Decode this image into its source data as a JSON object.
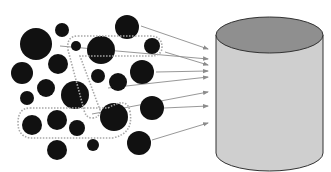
{
  "diagram": {
    "colors": {
      "background": "#ffffff",
      "item_fill": "#111111",
      "group_outline": "#a8a8a8",
      "arrow": "#8c8c8c",
      "cylinder_body": "#cfcfcf",
      "cylinder_top": "#8f8f8f",
      "cylinder_stroke": "#333333"
    },
    "items": [
      {
        "cx": 36,
        "cy": 44,
        "r": 16
      },
      {
        "cx": 62,
        "cy": 30,
        "r": 7
      },
      {
        "cx": 127,
        "cy": 27,
        "r": 12
      },
      {
        "cx": 76,
        "cy": 46,
        "r": 5
      },
      {
        "cx": 101,
        "cy": 50,
        "r": 14
      },
      {
        "cx": 152,
        "cy": 46,
        "r": 8
      },
      {
        "cx": 22,
        "cy": 73,
        "r": 11
      },
      {
        "cx": 58,
        "cy": 64,
        "r": 10
      },
      {
        "cx": 98,
        "cy": 76,
        "r": 7
      },
      {
        "cx": 118,
        "cy": 82,
        "r": 9
      },
      {
        "cx": 142,
        "cy": 72,
        "r": 12
      },
      {
        "cx": 46,
        "cy": 88,
        "r": 9
      },
      {
        "cx": 75,
        "cy": 95,
        "r": 14
      },
      {
        "cx": 27,
        "cy": 98,
        "r": 7
      },
      {
        "cx": 152,
        "cy": 108,
        "r": 12
      },
      {
        "cx": 32,
        "cy": 125,
        "r": 10
      },
      {
        "cx": 57,
        "cy": 120,
        "r": 10
      },
      {
        "cx": 77,
        "cy": 128,
        "r": 8
      },
      {
        "cx": 114,
        "cy": 117,
        "r": 14
      },
      {
        "cx": 139,
        "cy": 143,
        "r": 12
      },
      {
        "cx": 57,
        "cy": 150,
        "r": 10
      },
      {
        "cx": 93,
        "cy": 145,
        "r": 6
      }
    ],
    "groups": [
      {
        "name": "top-group",
        "path": "M78,36 L150,36 Q162,36 162,47 Q162,56 150,56 L80,56 L100,110 Q100,118 92,118 Q86,118 84,110 L68,50 Q66,36 78,36 Z"
      },
      {
        "name": "bottom-group",
        "path": "M30,108 L108,108 Q128,96 130,112 Q134,134 112,138 L30,138 Q18,136 18,123 Q18,108 30,108 Z"
      }
    ],
    "arrows": [
      {
        "x1": 141,
        "y1": 26,
        "x2": 208,
        "y2": 49
      },
      {
        "x1": 60,
        "y1": 46,
        "x2": 208,
        "y2": 59
      },
      {
        "x1": 165,
        "y1": 52,
        "x2": 208,
        "y2": 65
      },
      {
        "x1": 156,
        "y1": 72,
        "x2": 208,
        "y2": 71
      },
      {
        "x1": 108,
        "y1": 88,
        "x2": 208,
        "y2": 77
      },
      {
        "x1": 92,
        "y1": 114,
        "x2": 208,
        "y2": 92
      },
      {
        "x1": 164,
        "y1": 108,
        "x2": 208,
        "y2": 106
      },
      {
        "x1": 152,
        "y1": 140,
        "x2": 208,
        "y2": 123
      }
    ],
    "cylinder": {
      "cx": 269.5,
      "top_y": 35,
      "bottom_y": 153,
      "rx": 53.5,
      "ry": 18
    }
  }
}
